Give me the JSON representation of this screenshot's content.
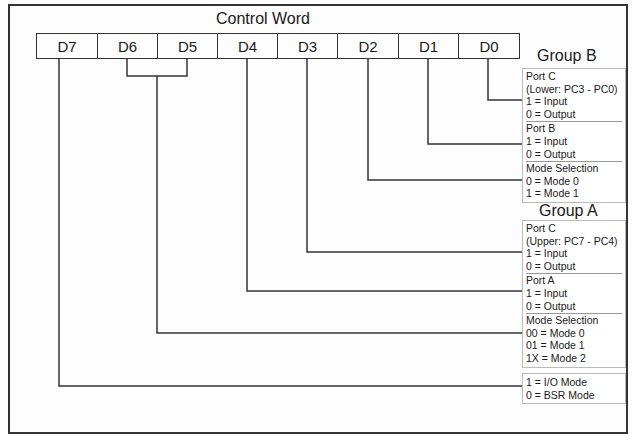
{
  "diagram": {
    "title": "Control Word",
    "bits": [
      "D7",
      "D6",
      "D5",
      "D4",
      "D3",
      "D2",
      "D1",
      "D0"
    ],
    "group_b": {
      "label": "Group B",
      "sections": [
        {
          "lines": [
            "Port C",
            "(Lower: PC3 - PC0)",
            "1 = Input",
            "0 = Output"
          ]
        },
        {
          "lines": [
            "Port B",
            "1 = Input",
            "0 = Output"
          ]
        },
        {
          "lines": [
            "Mode Selection",
            "0 = Mode 0",
            "1 = Mode 1"
          ]
        }
      ]
    },
    "group_a": {
      "label": "Group A",
      "sections": [
        {
          "lines": [
            "Port C",
            "(Upper: PC7 - PC4)",
            "1 = Input",
            "0 = Output"
          ]
        },
        {
          "lines": [
            "Port A",
            "1 = Input",
            "0 = Output"
          ]
        },
        {
          "lines": [
            "Mode Selection",
            "00 = Mode 0",
            "01 = Mode 1",
            "1X = Mode 2"
          ]
        }
      ]
    },
    "mode_flag": {
      "lines": [
        "1 = I/O Mode",
        "0 = BSR Mode"
      ]
    }
  }
}
